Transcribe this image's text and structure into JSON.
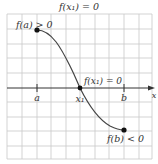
{
  "title": "f(x₁) = 0",
  "labels": {
    "fa": "f(a) > 0",
    "fb": "f(b) < 0",
    "fx1": "f(x₁) = 0",
    "a": "a",
    "b": "b",
    "x1": "x₁",
    "x_axis": "x"
  },
  "colors": {
    "grid": "#c8c8c8",
    "axis": "#333333",
    "curve": "#444444",
    "point": "#111111"
  },
  "diagram": {
    "points": [
      {
        "name": "f(a)",
        "sign": "positive"
      },
      {
        "name": "x1",
        "value": 0
      },
      {
        "name": "f(b)",
        "sign": "negative"
      }
    ]
  }
}
